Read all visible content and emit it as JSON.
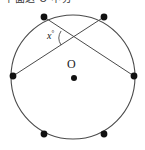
{
  "figure": {
    "type": "circle-geometry-diagram",
    "top_text": "下面这 O 中分",
    "top_text_note": "cropped-header-text",
    "center_label": "O",
    "angle_label": "x",
    "angle_degree_symbol": "°",
    "colors": {
      "stroke": "#4a4a4a",
      "point_fill": "#111111",
      "background": "#ffffff",
      "text": "#1a1a1a"
    },
    "circle": {
      "cx": 73,
      "cy": 77,
      "r": 62,
      "stroke_width": 1.1
    },
    "center_dot": {
      "cx": 74,
      "cy": 78,
      "r": 3.0
    },
    "points": [
      {
        "name": "point-top-left",
        "cx": 44,
        "cy": 17,
        "r": 3.4
      },
      {
        "name": "point-top-right",
        "cx": 104,
        "cy": 17,
        "r": 3.4
      },
      {
        "name": "point-left",
        "cx": 13,
        "cy": 76,
        "r": 3.4
      },
      {
        "name": "point-right",
        "cx": 134,
        "cy": 76,
        "r": 3.4
      },
      {
        "name": "point-bottom-left",
        "cx": 44,
        "cy": 134,
        "r": 3.4
      },
      {
        "name": "point-bottom-right",
        "cx": 104,
        "cy": 134,
        "r": 3.4
      }
    ],
    "chords": [
      {
        "name": "chord-topleft-to-right",
        "x1": 44,
        "y1": 17,
        "x2": 134,
        "y2": 76
      },
      {
        "name": "chord-topright-to-left",
        "x1": 104,
        "y1": 17,
        "x2": 13,
        "y2": 76
      }
    ],
    "intersection": {
      "x": 72,
      "y": 38
    },
    "angle_arc": {
      "cx": 72,
      "cy": 38,
      "r": 13,
      "start_deg": 147,
      "end_deg": 213
    }
  }
}
